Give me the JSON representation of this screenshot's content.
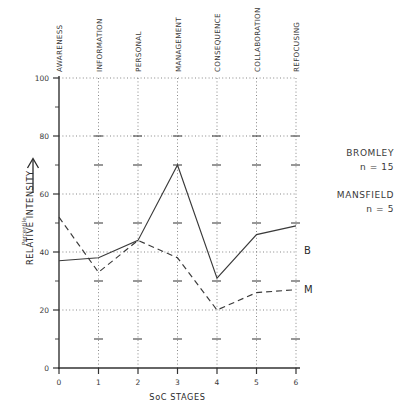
{
  "chart_data": {
    "type": "line",
    "title": "",
    "xlabel": "SoC STAGES",
    "ylabel": "RELATIVE INTENSITY",
    "ylabel_sub": "Percentile",
    "xlim": [
      0,
      6
    ],
    "ylim": [
      0,
      100
    ],
    "grid": true,
    "x": [
      0,
      1,
      2,
      3,
      4,
      5,
      6
    ],
    "xtick_labels": [
      "0",
      "1",
      "2",
      "3",
      "4",
      "5",
      "6"
    ],
    "ytick_labels": [
      "0",
      "20",
      "40",
      "60",
      "80",
      "100"
    ],
    "ytick_values": [
      0,
      20,
      40,
      60,
      80,
      100
    ],
    "yminor_values": [
      10,
      30,
      50,
      70,
      90
    ],
    "stage_names": [
      "AWARENESS",
      "INFORMATION",
      "PERSONAL",
      "MANAGEMENT",
      "CONSEQUENCE",
      "COLLABORATION",
      "REFOCUSING"
    ],
    "series": [
      {
        "name": "Bromley",
        "tag": "B",
        "style": "solid",
        "values": [
          37,
          38,
          44,
          70,
          31,
          46,
          49
        ]
      },
      {
        "name": "Mansfield",
        "tag": "M",
        "style": "dashed",
        "values": [
          52,
          33,
          44,
          38,
          20,
          26,
          27
        ]
      }
    ],
    "legend_position": "right",
    "legend": [
      {
        "name": "BROMLEY",
        "n_label": "n = 15"
      },
      {
        "name": "MANSFIELD",
        "n_label": "n = 5"
      }
    ]
  }
}
